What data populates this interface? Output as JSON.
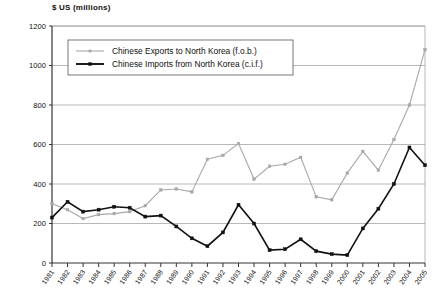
{
  "chart_data": {
    "type": "line",
    "title": "$ US (millions)",
    "xlabel": "",
    "ylabel": "$ US (millions)",
    "ylim": [
      0,
      1200
    ],
    "yticks": [
      0,
      200,
      400,
      600,
      800,
      1000,
      1200
    ],
    "grid": true,
    "legend_position": "top-center-inside",
    "categories": [
      "1981",
      "1982",
      "1983",
      "1984",
      "1985",
      "1986",
      "1987",
      "1988",
      "1989",
      "1990",
      "1991",
      "1992",
      "1993",
      "1994",
      "1995",
      "1996",
      "1997",
      "1998",
      "1999",
      "2000",
      "2001",
      "2002",
      "2003",
      "2004",
      "2005"
    ],
    "series": [
      {
        "name": "Chinese Exports to North Korea (f.o.b.)",
        "color": "#a8a8a8",
        "marker": "square",
        "values": [
          300,
          270,
          225,
          245,
          250,
          260,
          290,
          370,
          375,
          360,
          525,
          545,
          605,
          425,
          490,
          500,
          535,
          335,
          320,
          455,
          565,
          470,
          625,
          800,
          1080
        ]
      },
      {
        "name": "Chinese Imports from North Korea (c.i.f.)",
        "color": "#111111",
        "marker": "square",
        "values": [
          230,
          310,
          260,
          270,
          285,
          280,
          235,
          240,
          185,
          125,
          85,
          155,
          295,
          200,
          65,
          70,
          120,
          60,
          45,
          40,
          175,
          275,
          400,
          585,
          495
        ]
      }
    ]
  },
  "legend": {
    "items": [
      {
        "label": "Chinese Exports to North Korea (f.o.b.)",
        "color": "#a8a8a8"
      },
      {
        "label": "Chinese Imports from North Korea (c.i.f.)",
        "color": "#111111"
      }
    ]
  }
}
